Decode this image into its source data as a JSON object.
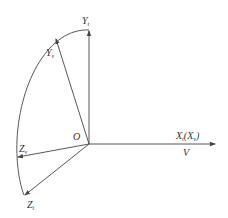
{
  "diagram": {
    "type": "coordinate-axes",
    "origin": {
      "label": "O"
    },
    "axes": [
      {
        "id": "yt",
        "label": "Y",
        "subscript": "t"
      },
      {
        "id": "yv",
        "label": "Y",
        "subscript": "v"
      },
      {
        "id": "xt",
        "label": "X",
        "subscript": "t",
        "paren_label": "X",
        "paren_subscript": "v"
      },
      {
        "id": "zv",
        "label": "Z",
        "subscript": "v"
      },
      {
        "id": "zt",
        "label": "Z",
        "subscript": "t"
      }
    ],
    "velocity": {
      "label": "V"
    },
    "colors": {
      "line": "#444444",
      "text": "#333333",
      "background": "#ffffff"
    }
  }
}
